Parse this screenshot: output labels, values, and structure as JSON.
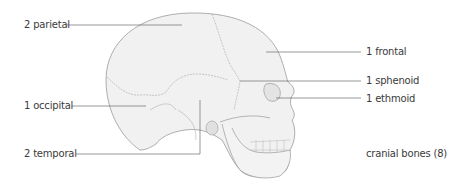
{
  "diagram": {
    "caption": "cranial bones (8)",
    "labels": [
      {
        "id": "parietal",
        "text": "2 parietal",
        "side": "left"
      },
      {
        "id": "occipital",
        "text": "1 occipital",
        "side": "left"
      },
      {
        "id": "temporal",
        "text": "2 temporal",
        "side": "left"
      },
      {
        "id": "frontal",
        "text": "1 frontal",
        "side": "right"
      },
      {
        "id": "sphenoid",
        "text": "1 sphenoid",
        "side": "right"
      },
      {
        "id": "ethmoid",
        "text": "1 ethmoid",
        "side": "right"
      }
    ]
  },
  "colors": {
    "line": "#555555",
    "outline": "#9a9a9a",
    "fill": "#f1f1f1",
    "text": "#3a3a3a"
  }
}
